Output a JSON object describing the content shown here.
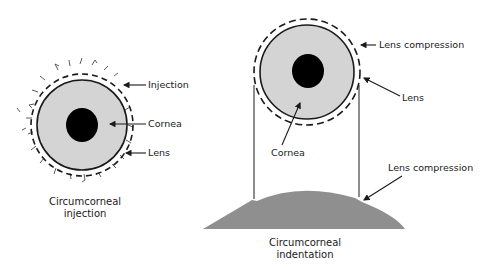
{
  "left_figure": {
    "caption_line1": "Circumcorneal",
    "caption_line2": "injection",
    "labels": {
      "injection": "Injection",
      "cornea": "Cornea",
      "lens": "Lens"
    }
  },
  "right_figure": {
    "caption_line1": "Circumcorneal",
    "caption_line2": "indentation",
    "labels": {
      "lens_compression_top": "Lens compression",
      "lens": "Lens",
      "cornea": "Cornea",
      "lens_compression_bottom": "Lens compression"
    }
  },
  "colors": {
    "iris_fill": "#d4d4d4",
    "pupil_fill": "#000000",
    "line": "#1a1a1a",
    "indentation_fill": "#8f8f8f"
  }
}
